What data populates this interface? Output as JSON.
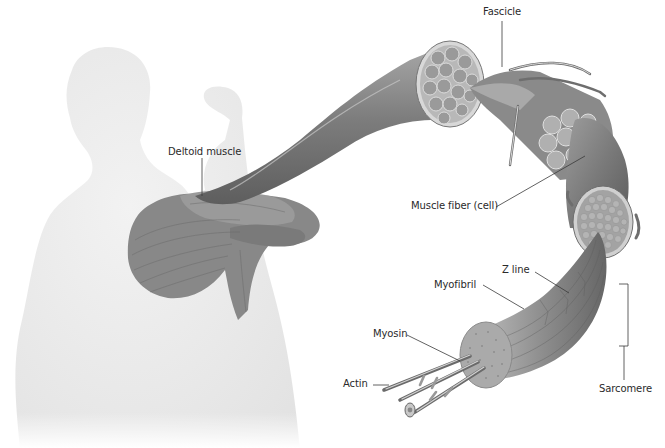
{
  "diagram": {
    "colors": {
      "background": "#ffffff",
      "body_silhouette": "#ececec",
      "muscle_dark": "#6f6f6f",
      "muscle_mid": "#8c8c8c",
      "muscle_light": "#b3b3b3",
      "cross_section_fill": "#9a9a9a",
      "cross_section_cell": "#a8a8a8",
      "label_text": "#2a2a2a",
      "leader_line": "#3a3a3a"
    },
    "labels": {
      "deltoid": "Deltoid muscle",
      "fascicle": "Fascicle",
      "muscle_fiber": "Muscle fiber (cell)",
      "z_line": "Z line",
      "myofibril": "Myofibril",
      "myosin": "Myosin",
      "actin": "Actin",
      "sarcomere": "Sarcomere"
    }
  }
}
